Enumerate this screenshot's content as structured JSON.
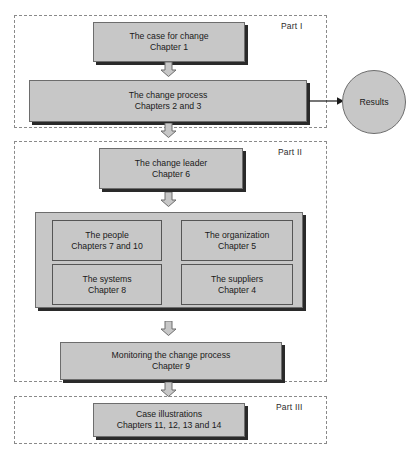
{
  "diagram": {
    "colors": {
      "box_fill": "#c7c7c7",
      "box_border": "#6d6d6d",
      "shadow": "#2a2a2a",
      "dashed_border": "#8a8a8a",
      "text": "#1a1a1a",
      "background": "#ffffff"
    },
    "parts": [
      {
        "id": "part1",
        "label": "Part I"
      },
      {
        "id": "part2",
        "label": "Part II"
      },
      {
        "id": "part3",
        "label": "Part III"
      }
    ],
    "boxes": [
      {
        "id": "case-for-change",
        "line1": "The case for change",
        "line2": "Chapter 1"
      },
      {
        "id": "change-process",
        "line1": "The change process",
        "line2": "Chapters 2 and 3"
      },
      {
        "id": "change-leader",
        "line1": "The change leader",
        "line2": "Chapter 6"
      },
      {
        "id": "people",
        "line1": "The people",
        "line2": "Chapters 7 and 10"
      },
      {
        "id": "organization",
        "line1": "The organization",
        "line2": "Chapter 5"
      },
      {
        "id": "systems",
        "line1": "The systems",
        "line2": "Chapter 8"
      },
      {
        "id": "suppliers",
        "line1": "The suppliers",
        "line2": "Chapter 4"
      },
      {
        "id": "monitoring",
        "line1": "Monitoring the change process",
        "line2": "Chapter 9"
      },
      {
        "id": "case-illustrations",
        "line1": "Case illustrations",
        "line2": "Chapters 11, 12, 13 and 14"
      }
    ],
    "results": {
      "label": "Results"
    },
    "connectors": [
      {
        "id": "arrow-case-to-process",
        "type": "block-arrow-down"
      },
      {
        "id": "arrow-process-to-leader",
        "type": "block-arrow-down"
      },
      {
        "id": "arrow-leader-to-group",
        "type": "block-arrow-down"
      },
      {
        "id": "arrow-group-to-monitoring",
        "type": "block-arrow-down"
      },
      {
        "id": "arrow-monitoring-to-cases",
        "type": "block-arrow-down"
      },
      {
        "id": "arrow-process-to-results",
        "type": "line-arrow-right"
      }
    ]
  }
}
